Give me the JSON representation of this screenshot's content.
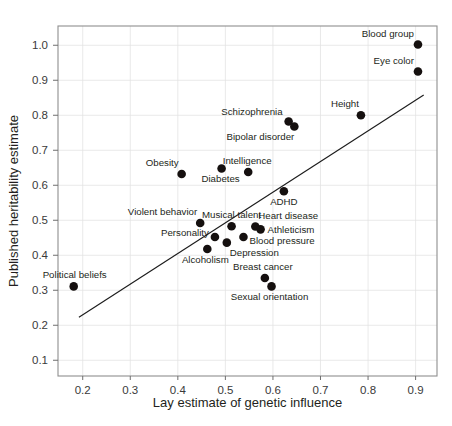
{
  "chart_data": {
    "type": "scatter",
    "title": "",
    "xlabel": "Lay estimate of genetic influence",
    "ylabel": "Published heritability estimate",
    "xlim": [
      0.148,
      0.945
    ],
    "ylim": [
      0.055,
      1.055
    ],
    "xticks": [
      0.2,
      0.3,
      0.4,
      0.5,
      0.6,
      0.7,
      0.8,
      0.9
    ],
    "xtick_labels": [
      "0.2",
      "0.3",
      "0.4",
      "0.5",
      "0.6",
      "0.7",
      "0.8",
      "0.9"
    ],
    "yticks": [
      0.1,
      0.2,
      0.3,
      0.4,
      0.5,
      0.6,
      0.7,
      0.8,
      0.9,
      1.0
    ],
    "ytick_labels": [
      "0.1",
      "0.2",
      "0.3",
      "0.4",
      "0.5",
      "0.6",
      "0.7",
      "0.8",
      "0.9",
      "1.0"
    ],
    "grid": true,
    "legend": "none",
    "marker_color": "#15100f",
    "line_color": "#1c1c1c",
    "grid_color": "#e3e3e3",
    "frame_color": "#8f8f8f",
    "trendline": {
      "x0": 0.192,
      "y0": 0.223,
      "x1": 0.917,
      "y1": 0.858
    },
    "points": [
      {
        "label": "Blood group",
        "x": 0.905,
        "y": 1.002,
        "label_dx": -4,
        "label_dy": -8,
        "anchor": "end"
      },
      {
        "label": "Eye color",
        "x": 0.905,
        "y": 0.925,
        "label_dx": -4,
        "label_dy": -8,
        "anchor": "end"
      },
      {
        "label": "Height",
        "x": 0.785,
        "y": 0.8,
        "label_dx": -2,
        "label_dy": -8,
        "anchor": "end"
      },
      {
        "label": "Schizophrenia",
        "x": 0.633,
        "y": 0.782,
        "label_dx": -6,
        "label_dy": -7,
        "anchor": "end"
      },
      {
        "label": "Bipolar disorder",
        "x": 0.645,
        "y": 0.768,
        "label_dx": 0,
        "label_dy": 14,
        "anchor": "end"
      },
      {
        "label": "Intelligence",
        "x": 0.548,
        "y": 0.638,
        "label_dx": -1,
        "label_dy": -8,
        "anchor": "middle"
      },
      {
        "label": "Obesity",
        "x": 0.408,
        "y": 0.632,
        "label_dx": -3,
        "label_dy": -8,
        "anchor": "end"
      },
      {
        "label": "Diabetes",
        "x": 0.492,
        "y": 0.648,
        "label_dx": -1,
        "label_dy": 14,
        "anchor": "middle"
      },
      {
        "label": "ADHD",
        "x": 0.623,
        "y": 0.583,
        "label_dx": 0,
        "label_dy": 14,
        "anchor": "middle"
      },
      {
        "label": "Violent behavior",
        "x": 0.447,
        "y": 0.492,
        "label_dx": -3,
        "label_dy": -8,
        "anchor": "end"
      },
      {
        "label": "Musical talent",
        "x": 0.513,
        "y": 0.483,
        "label_dx": 0,
        "label_dy": -8,
        "anchor": "middle"
      },
      {
        "label": "Heart disease",
        "x": 0.563,
        "y": 0.482,
        "label_dx": 3,
        "label_dy": -8,
        "anchor": "start"
      },
      {
        "label": "Athleticism",
        "x": 0.574,
        "y": 0.474,
        "label_dx": 7,
        "label_dy": 4,
        "anchor": "start"
      },
      {
        "label": "Personality",
        "x": 0.478,
        "y": 0.452,
        "label_dx": -6,
        "label_dy": -1,
        "anchor": "end"
      },
      {
        "label": "Blood pressure",
        "x": 0.538,
        "y": 0.452,
        "label_dx": 6,
        "label_dy": 7,
        "anchor": "start"
      },
      {
        "label": "Depression",
        "x": 0.503,
        "y": 0.436,
        "label_dx": 3,
        "label_dy": 13,
        "anchor": "start"
      },
      {
        "label": "Alcoholism",
        "x": 0.462,
        "y": 0.418,
        "label_dx": -2,
        "label_dy": 14,
        "anchor": "middle"
      },
      {
        "label": "Breast cancer",
        "x": 0.583,
        "y": 0.335,
        "label_dx": -2,
        "label_dy": -8,
        "anchor": "middle"
      },
      {
        "label": "Sexual orientation",
        "x": 0.597,
        "y": 0.311,
        "label_dx": -2,
        "label_dy": 14,
        "anchor": "middle"
      },
      {
        "label": "Political beliefs",
        "x": 0.181,
        "y": 0.311,
        "label_dx": 1,
        "label_dy": -8,
        "anchor": "middle"
      }
    ]
  },
  "caption": {
    "clipped_text": ""
  }
}
